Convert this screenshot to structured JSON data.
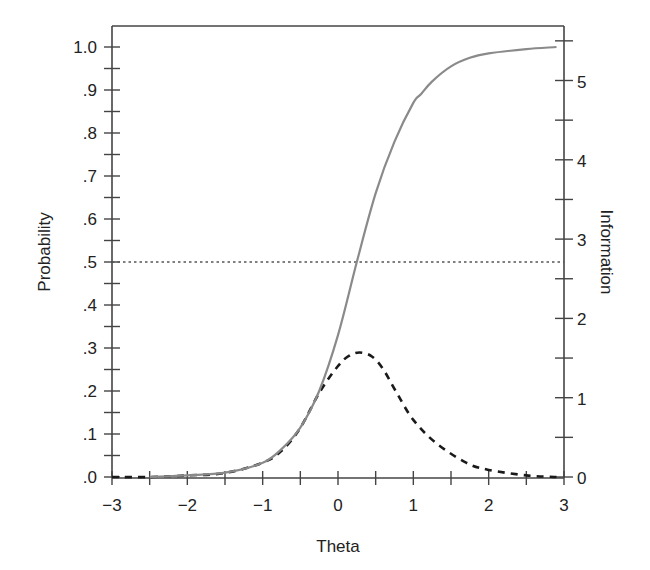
{
  "chart_data": {
    "type": "line",
    "title": "",
    "xlabel": "Theta",
    "ylabel": "Probability",
    "y2label": "Information",
    "xlim": [
      -3,
      3
    ],
    "ylim": [
      0,
      1.0
    ],
    "y2lim": [
      0,
      5.5
    ],
    "grid": false,
    "legend": null,
    "x_ticks": [
      "−3",
      "−2",
      "−1",
      "0",
      "1",
      "2",
      "3"
    ],
    "x_tick_values": [
      -3,
      -2,
      -1,
      0,
      1,
      2,
      3
    ],
    "x_minor_step": 0.5,
    "y_ticks": [
      ".0",
      ".1",
      ".2",
      ".3",
      ".4",
      ".5",
      ".6",
      ".7",
      ".8",
      ".9",
      "1.0"
    ],
    "y_tick_values": [
      0,
      0.1,
      0.2,
      0.3,
      0.4,
      0.5,
      0.6,
      0.7,
      0.8,
      0.9,
      1.0
    ],
    "y_minor_step": 0.05,
    "y2_ticks": [
      "0",
      "1",
      "2",
      "3",
      "4",
      "5"
    ],
    "y2_tick_values": [
      0,
      1,
      2,
      3,
      4,
      5
    ],
    "y2_minor_step": 0.5,
    "reference_lines": [
      {
        "axis": "y",
        "value": 0.5,
        "style": "dotted"
      }
    ],
    "series": [
      {
        "name": "Probability (item characteristic curve)",
        "axis": "left",
        "style": "solid",
        "color": "#8a8a8a",
        "x": [
          -2.5,
          -2.0,
          -1.5,
          -1.0,
          -0.75,
          -0.5,
          -0.25,
          0.0,
          0.25,
          0.5,
          0.75,
          1.0,
          1.1,
          1.25,
          1.5,
          1.75,
          2.0,
          2.5,
          2.9
        ],
        "values": [
          0.0,
          0.004,
          0.01,
          0.033,
          0.065,
          0.115,
          0.2,
          0.33,
          0.5,
          0.66,
          0.78,
          0.87,
          0.89,
          0.92,
          0.955,
          0.975,
          0.985,
          0.995,
          1.0
        ]
      },
      {
        "name": "Information (item information function)",
        "axis": "right",
        "style": "dashed",
        "color": "#1a1a1a",
        "x": [
          -3.0,
          -2.5,
          -2.0,
          -1.5,
          -1.0,
          -0.75,
          -0.5,
          -0.25,
          0.0,
          0.15,
          0.29,
          0.45,
          0.6,
          0.78,
          1.0,
          1.3,
          1.7,
          2.0,
          2.5,
          2.9
        ],
        "values": [
          0.0,
          0.0,
          0.02,
          0.05,
          0.18,
          0.33,
          0.62,
          1.06,
          1.4,
          1.53,
          1.57,
          1.52,
          1.36,
          1.06,
          0.72,
          0.43,
          0.18,
          0.09,
          0.02,
          0.0
        ]
      }
    ]
  }
}
